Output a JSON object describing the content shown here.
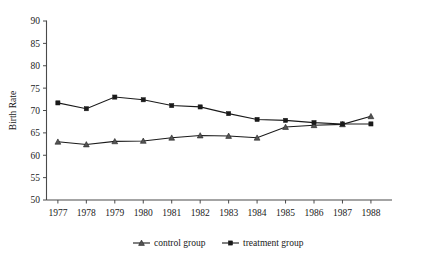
{
  "chart_data": {
    "type": "line",
    "title": "",
    "xlabel": "",
    "ylabel": "Birth Rate",
    "x": [
      1977,
      1978,
      1979,
      1980,
      1981,
      1982,
      1983,
      1984,
      1985,
      1986,
      1987,
      1988
    ],
    "xtick_labels": [
      "1977",
      "1978",
      "1979",
      "1980",
      "1981",
      "1982",
      "1983",
      "1984",
      "1985",
      "1986",
      "1987",
      "1988"
    ],
    "ytick_labels": [
      "50",
      "55",
      "60",
      "65",
      "70",
      "75",
      "80",
      "85",
      "90"
    ],
    "yticks": [
      50,
      55,
      60,
      65,
      70,
      75,
      80,
      85,
      90
    ],
    "ylim": [
      50,
      90
    ],
    "xlim": [
      1976.6,
      1988.6
    ],
    "grid": false,
    "legend_position": "bottom-center",
    "series": [
      {
        "name": "control group",
        "marker": "triangle",
        "color": "#1a1a1a",
        "values": [
          63.0,
          62.4,
          63.1,
          63.2,
          63.9,
          64.4,
          64.3,
          63.9,
          66.3,
          66.7,
          66.9,
          68.7
        ]
      },
      {
        "name": "treatment group",
        "marker": "square",
        "color": "#1a1a1a",
        "values": [
          71.7,
          70.4,
          73.0,
          72.4,
          71.1,
          70.8,
          69.3,
          68.0,
          67.8,
          67.3,
          67.0,
          67.0
        ]
      }
    ]
  },
  "legend": {
    "items": [
      {
        "label": "control group",
        "marker": "triangle"
      },
      {
        "label": "treatment group",
        "marker": "square"
      }
    ]
  },
  "colors": {
    "axis": "#4a4a4a",
    "text": "#1a1a1a",
    "background": "#ffffff",
    "series_line": "#1a1a1a"
  }
}
